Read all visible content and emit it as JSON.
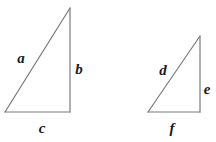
{
  "figure": {
    "type": "geometry-diagram",
    "background_color": "#ffffff",
    "stroke_color": "#7a7a7a",
    "stroke_width": 1.2,
    "label_color": "#1a1a1a",
    "shapes": [
      {
        "name": "left-triangle",
        "kind": "right-triangle",
        "vertices": {
          "apex": [
            70,
            8
          ],
          "bottom_right": [
            70,
            112
          ],
          "bottom_left": [
            5,
            112
          ]
        },
        "sides": [
          {
            "id": "a",
            "label": "a",
            "from": "apex",
            "to": "bottom_left",
            "role": "hypotenuse"
          },
          {
            "id": "b",
            "label": "b",
            "from": "apex",
            "to": "bottom_right",
            "role": "vertical-leg"
          },
          {
            "id": "c",
            "label": "c",
            "from": "bottom_left",
            "to": "bottom_right",
            "role": "horizontal-leg"
          }
        ]
      },
      {
        "name": "right-triangle",
        "kind": "right-triangle",
        "vertices": {
          "apex": [
            200,
            36
          ],
          "bottom_right": [
            200,
            112
          ],
          "bottom_left": [
            148,
            112
          ]
        },
        "sides": [
          {
            "id": "d",
            "label": "d",
            "from": "apex",
            "to": "bottom_left",
            "role": "hypotenuse"
          },
          {
            "id": "e",
            "label": "e",
            "from": "apex",
            "to": "bottom_right",
            "role": "vertical-leg"
          },
          {
            "id": "f",
            "label": "f",
            "from": "bottom_left",
            "to": "bottom_right",
            "role": "horizontal-leg"
          }
        ]
      }
    ],
    "labels": [
      {
        "id": "a",
        "text": "a",
        "x": 21,
        "y": 58
      },
      {
        "id": "b",
        "text": "b",
        "x": 79,
        "y": 69
      },
      {
        "id": "c",
        "text": "c",
        "x": 42,
        "y": 128
      },
      {
        "id": "d",
        "text": "d",
        "x": 163,
        "y": 70
      },
      {
        "id": "e",
        "text": "e",
        "x": 207,
        "y": 89
      },
      {
        "id": "f",
        "text": "f",
        "x": 172,
        "y": 128
      }
    ]
  }
}
